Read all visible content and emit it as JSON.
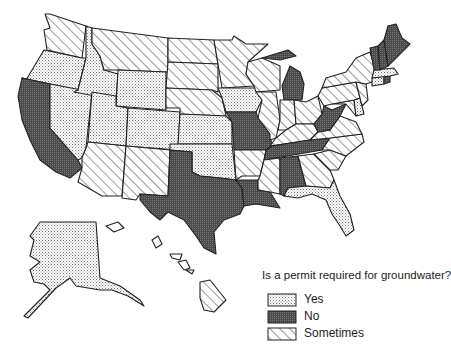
{
  "map_title": "Is a permit required for groundwater?",
  "legend": [
    {
      "key": "yes",
      "label": "Yes",
      "pattern": "dots",
      "color": "#cfcfcf"
    },
    {
      "key": "no",
      "label": "No",
      "pattern": "dark-stipple",
      "color": "#555555"
    },
    {
      "key": "sometimes",
      "label": "Sometimes",
      "pattern": "diagonal-hatch",
      "color": "#ffffff"
    }
  ],
  "states": {
    "WA": "sometimes",
    "OR": "yes",
    "CA": "no",
    "ID": "yes",
    "NV": "yes",
    "MT": "sometimes",
    "WY": "yes",
    "UT": "yes",
    "CO": "yes",
    "AZ": "sometimes",
    "NM": "sometimes",
    "ND": "sometimes",
    "SD": "sometimes",
    "NE": "sometimes",
    "KS": "yes",
    "OK": "yes",
    "TX": "no",
    "MN": "sometimes",
    "IA": "yes",
    "MO": "no",
    "AR": "sometimes",
    "LA": "no",
    "WI": "sometimes",
    "IL": "sometimes",
    "MI": "no",
    "IN": "sometimes",
    "OH": "sometimes",
    "KY": "sometimes",
    "TN": "no",
    "MS": "sometimes",
    "AL": "no",
    "GA": "sometimes",
    "FL": "yes",
    "SC": "sometimes",
    "NC": "sometimes",
    "VA": "sometimes",
    "WV": "no",
    "MD": "sometimes",
    "DE": "yes",
    "PA": "sometimes",
    "NJ": "sometimes",
    "NY": "sometimes",
    "CT": "yes",
    "RI": "no",
    "MA": "yes",
    "VT": "no",
    "NH": "no",
    "ME": "no",
    "AK": "yes",
    "HI": "sometimes"
  }
}
